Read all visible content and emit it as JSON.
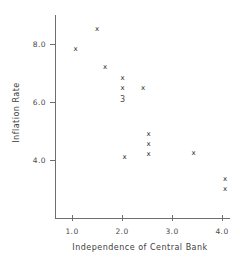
{
  "chart_data": {
    "type": "scatter",
    "title": "",
    "xlabel": "Independence of Central Bank",
    "ylabel": "Inflation Rate",
    "xlim": [
      0.6,
      4.4
    ],
    "ylim": [
      2.55,
      9.0
    ],
    "xticks": [
      1.0,
      2.0,
      3.0,
      4.0
    ],
    "yticks": [
      4.0,
      6.0,
      8.0
    ],
    "xticklabels": [
      "1.0",
      "2.0",
      "3.0",
      "4.0"
    ],
    "yticklabels": [
      "4.0",
      "6.0",
      "8.0"
    ],
    "grid": false,
    "legend": null,
    "marker": "x",
    "marker_color": "#2b2b2b",
    "axis_color": "#6e6e6e",
    "points": [
      {
        "x": 1.5,
        "y": 8.52
      },
      {
        "x": 1.07,
        "y": 7.83
      },
      {
        "x": 1.66,
        "y": 7.22
      },
      {
        "x": 2.01,
        "y": 6.83
      },
      {
        "x": 2.01,
        "y": 6.5
      },
      {
        "x": 2.42,
        "y": 6.5
      },
      {
        "x": 2.53,
        "y": 4.9
      },
      {
        "x": 2.53,
        "y": 4.55
      },
      {
        "x": 2.53,
        "y": 4.21
      },
      {
        "x": 2.05,
        "y": 4.1
      },
      {
        "x": 3.43,
        "y": 4.24
      },
      {
        "x": 4.06,
        "y": 3.35
      },
      {
        "x": 4.06,
        "y": 3.0
      }
    ],
    "annotations": [
      {
        "x": 2.01,
        "y": 6.07,
        "text": "3",
        "note": "overplotted-point-count"
      }
    ]
  }
}
